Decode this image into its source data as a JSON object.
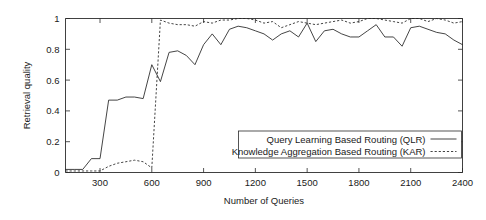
{
  "chart_data": {
    "type": "line",
    "title": "",
    "xlabel": "Number of Queries",
    "ylabel": "Retrieval quality",
    "xlim": [
      100,
      2400
    ],
    "ylim": [
      0,
      1
    ],
    "grid": false,
    "legend_position": "bottom-right",
    "xticks": [
      "300",
      "600",
      "900",
      "1200",
      "1500",
      "1800",
      "2100",
      "2400"
    ],
    "xtick_values": [
      300,
      600,
      900,
      1200,
      1500,
      1800,
      2100,
      2400
    ],
    "yticks": [
      "0",
      "0.2",
      "0.4",
      "0.6",
      "0.8",
      "1"
    ],
    "ytick_values": [
      0,
      0.2,
      0.4,
      0.6,
      0.8,
      1
    ],
    "x": [
      100,
      150,
      200,
      250,
      300,
      350,
      400,
      450,
      500,
      550,
      600,
      650,
      700,
      750,
      800,
      850,
      900,
      950,
      1000,
      1050,
      1100,
      1150,
      1200,
      1250,
      1300,
      1350,
      1400,
      1450,
      1500,
      1550,
      1600,
      1650,
      1700,
      1750,
      1800,
      1850,
      1900,
      1950,
      2000,
      2050,
      2100,
      2150,
      2200,
      2250,
      2300,
      2350,
      2400
    ],
    "series": [
      {
        "name": "Query Learning Based Routing (QLR)",
        "style": "solid",
        "color": "#242424",
        "values": [
          0.02,
          0.02,
          0.02,
          0.09,
          0.09,
          0.47,
          0.47,
          0.49,
          0.49,
          0.48,
          0.7,
          0.59,
          0.78,
          0.79,
          0.76,
          0.7,
          0.83,
          0.9,
          0.83,
          0.93,
          0.95,
          0.94,
          0.92,
          0.9,
          0.86,
          0.9,
          0.92,
          0.88,
          0.97,
          0.85,
          0.92,
          0.93,
          0.9,
          0.88,
          0.88,
          0.92,
          0.96,
          0.88,
          0.88,
          0.82,
          0.94,
          0.95,
          0.93,
          0.91,
          0.9,
          0.86,
          0.83
        ]
      },
      {
        "name": "Knowledge Aggregation Based Routing (KAR)",
        "style": "dotted",
        "color": "#242424",
        "values": [
          0.01,
          0.01,
          0.01,
          0.01,
          0.01,
          0.04,
          0.06,
          0.07,
          0.08,
          0.07,
          0.03,
          0.99,
          0.97,
          0.96,
          0.96,
          0.95,
          0.98,
          0.97,
          0.99,
          0.99,
          1.0,
          1.0,
          0.99,
          0.97,
          0.98,
          0.94,
          0.96,
          0.98,
          0.97,
          0.96,
          0.97,
          0.98,
          0.99,
          0.97,
          0.98,
          1.0,
          1.0,
          0.99,
          0.98,
          0.97,
          1.0,
          1.0,
          0.98,
          1.0,
          0.99,
          0.97,
          0.98
        ]
      }
    ]
  },
  "legend": {
    "items": [
      {
        "label": "Query Learning Based Routing (QLR)",
        "style": "solid"
      },
      {
        "label": "Knowledge Aggregation Based Routing (KAR)",
        "style": "dotted"
      }
    ]
  }
}
